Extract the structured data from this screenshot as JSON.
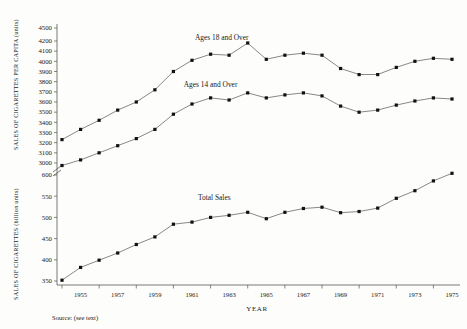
{
  "axis_titles": {
    "y_upper": "SALES OF CIGARETTES PER CAPITA (units)",
    "y_lower": "SALES OF CIGARETTES (billion units)",
    "x": "YEAR"
  },
  "source_note": "Source: (see text)",
  "chart_data": {
    "type": "line",
    "title": "",
    "xlabel": "YEAR",
    "ylabel": "SALES OF CIGARETTES PER CAPITA (units)",
    "ylabel_secondary": "SALES OF CIGARETTES (billion units)",
    "grid": false,
    "legend": "inline-annotations",
    "axis_break": true,
    "x": [
      1954,
      1955,
      1956,
      1957,
      1958,
      1959,
      1960,
      1961,
      1962,
      1963,
      1964,
      1965,
      1966,
      1967,
      1968,
      1969,
      1970,
      1971,
      1972,
      1973,
      1974,
      1975
    ],
    "x_tick_labels": [
      "1955",
      "1957",
      "1959",
      "1961",
      "1963",
      "1965",
      "1967",
      "1969",
      "1971",
      "1973",
      "1975"
    ],
    "y_upper_ticks": [
      3000,
      3100,
      3200,
      3300,
      3400,
      3500,
      3600,
      3700,
      3800,
      3900,
      4000,
      4100,
      4200,
      4500
    ],
    "y_lower_ticks": [
      350,
      400,
      450,
      500,
      550,
      600
    ],
    "y_upper_range": [
      3000,
      4500
    ],
    "y_lower_range": [
      350,
      600
    ],
    "series": [
      {
        "name": "Ages 18 and Over",
        "axis": "upper",
        "label_x": 1962.6,
        "label_y": 4230,
        "values": [
          3230,
          3330,
          3420,
          3520,
          3600,
          3720,
          3900,
          4010,
          4070,
          4060,
          4180,
          4020,
          4060,
          4080,
          4060,
          3930,
          3870,
          3870,
          3940,
          4000,
          4030,
          4020
        ]
      },
      {
        "name": "Ages 14 and Over",
        "axis": "upper",
        "label_x": 1962.0,
        "label_y": 3745,
        "values": [
          2975,
          3030,
          3100,
          3170,
          3240,
          3330,
          3480,
          3580,
          3640,
          3620,
          3690,
          3640,
          3670,
          3690,
          3660,
          3560,
          3500,
          3520,
          3570,
          3610,
          3640,
          3630
        ]
      },
      {
        "name": "Total Sales",
        "axis": "lower",
        "label_x": 1962.2,
        "label_y": 540,
        "values": [
          352,
          382,
          399,
          416,
          436,
          454,
          484,
          489,
          500,
          505,
          512,
          497,
          512,
          521,
          524,
          511,
          514,
          522,
          545,
          563,
          586,
          604
        ]
      }
    ]
  }
}
